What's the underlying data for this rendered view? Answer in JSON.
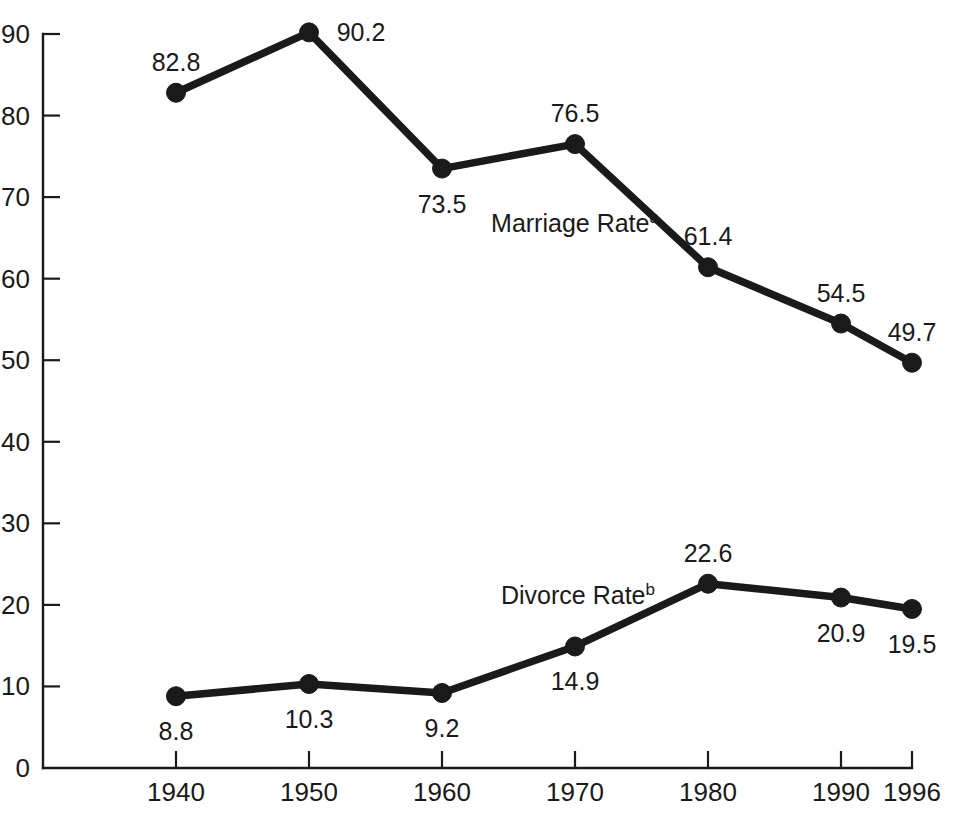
{
  "chart_data": {
    "type": "line",
    "title": "",
    "subtitle": "",
    "xlabel": "",
    "ylabel": "",
    "x": [
      "1940",
      "1950",
      "1960",
      "1970",
      "1980",
      "1990",
      "1996"
    ],
    "categories": [
      "1940",
      "1950",
      "1960",
      "1970",
      "1980",
      "1990",
      "1996"
    ],
    "xtick_labels": [
      "1940",
      "1950",
      "1960",
      "1970",
      "1980",
      "1990",
      "1996"
    ],
    "ytick_labels": [
      "0",
      "10",
      "20",
      "30",
      "40",
      "50",
      "60",
      "70",
      "80",
      "90"
    ],
    "ytick_values": [
      0,
      10,
      20,
      30,
      40,
      50,
      60,
      70,
      80,
      90
    ],
    "ylim": [
      0,
      90
    ],
    "grid": false,
    "legend_position": "inline-annotation",
    "series": [
      {
        "name": "Marriage Rate",
        "name_superscript": "a",
        "values": [
          82.8,
          90.2,
          73.5,
          76.5,
          61.4,
          54.5,
          49.7
        ],
        "labels": [
          "82.8",
          "90.2",
          "73.5",
          "76.5",
          "61.4",
          "54.5",
          "49.7"
        ],
        "label_positions": [
          "above",
          "right",
          "below",
          "above",
          "above",
          "above",
          "above"
        ],
        "color": "#1a1a1a",
        "annotation": {
          "text": "Marriage Rate",
          "superscript": "a",
          "x": 1965,
          "y": 71.5
        }
      },
      {
        "name": "Divorce Rate",
        "name_superscript": "b",
        "values": [
          8.8,
          10.3,
          9.2,
          14.9,
          22.6,
          20.9,
          19.5
        ],
        "labels": [
          "8.8",
          "10.3",
          "9.2",
          "14.9",
          "22.6",
          "20.9",
          "19.5"
        ],
        "label_positions": [
          "below",
          "below",
          "below",
          "below",
          "above",
          "below",
          "below"
        ],
        "color": "#1a1a1a",
        "annotation": {
          "text": "Divorce Rate",
          "superscript": "b",
          "x": 1965,
          "y": 24.5
        }
      }
    ]
  },
  "colors": {
    "background": "#ffffff",
    "ink": "#1a1a1a",
    "axis": "#1a1a1a",
    "series": "#1a1a1a"
  }
}
